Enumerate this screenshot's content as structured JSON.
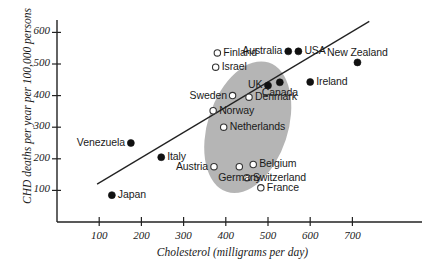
{
  "chart_data": {
    "type": "scatter",
    "title": "",
    "xlabel": "Cholesterol (milligrams per day)",
    "ylabel": "CHD deaths per year per 100,000 persons",
    "xlim": [
      0,
      760
    ],
    "ylim": [
      0,
      660
    ],
    "xticks": [
      100,
      200,
      300,
      400,
      500,
      600,
      700
    ],
    "yticks": [
      100,
      200,
      300,
      400,
      500,
      600
    ],
    "grid": false,
    "legend": "none",
    "marker_styles": {
      "filled": "solid black circle (outside cluster)",
      "open": "open circle (inside highlighted ellipse)"
    },
    "annotations": {
      "ellipse_note": "shaded gray ellipse highlighting the central European cluster",
      "trend_line": "upward-sloping straight regression line"
    },
    "trend_line": {
      "x1": 95,
      "y1": 120,
      "x2": 740,
      "y2": 635
    },
    "ellipse": {
      "cx": 452,
      "cy": 300,
      "rx": 95,
      "ry": 215,
      "rotation_deg": 18,
      "color": "#a8a8a8"
    },
    "points": [
      {
        "label": "Japan",
        "x": 130,
        "y": 85,
        "marker": "filled",
        "label_pos": "right"
      },
      {
        "label": "Venezuela",
        "x": 175,
        "y": 250,
        "marker": "filled",
        "label_pos": "left"
      },
      {
        "label": "Italy",
        "x": 247,
        "y": 205,
        "marker": "filled",
        "label_pos": "right"
      },
      {
        "label": "Austria",
        "x": 372,
        "y": 175,
        "marker": "open",
        "label_pos": "left"
      },
      {
        "label": "Finland",
        "x": 380,
        "y": 535,
        "marker": "open",
        "label_pos": "right"
      },
      {
        "label": "Israel",
        "x": 376,
        "y": 490,
        "marker": "open",
        "label_pos": "right"
      },
      {
        "label": "Sweden",
        "x": 416,
        "y": 400,
        "marker": "open",
        "label_pos": "left"
      },
      {
        "label": "Norway",
        "x": 370,
        "y": 352,
        "marker": "open",
        "label_pos": "right"
      },
      {
        "label": "Netherlands",
        "x": 395,
        "y": 300,
        "marker": "open",
        "label_pos": "right"
      },
      {
        "label": "Germany",
        "x": 432,
        "y": 175,
        "marker": "open",
        "label_pos": "below"
      },
      {
        "label": "Belgium",
        "x": 465,
        "y": 182,
        "marker": "open",
        "label_pos": "right"
      },
      {
        "label": "Switzerland",
        "x": 450,
        "y": 140,
        "marker": "open",
        "label_pos": "right"
      },
      {
        "label": "France",
        "x": 483,
        "y": 108,
        "marker": "open",
        "label_pos": "right"
      },
      {
        "label": "Denmark",
        "x": 455,
        "y": 395,
        "marker": "open",
        "label_pos": "right"
      },
      {
        "label": "UK",
        "x": 500,
        "y": 432,
        "marker": "filled",
        "label_pos": "left"
      },
      {
        "label": "Canada",
        "x": 528,
        "y": 442,
        "marker": "filled",
        "label_pos": "below"
      },
      {
        "label": "Australia",
        "x": 548,
        "y": 540,
        "marker": "filled",
        "label_pos": "left"
      },
      {
        "label": "USA",
        "x": 572,
        "y": 540,
        "marker": "filled",
        "label_pos": "right"
      },
      {
        "label": "Ireland",
        "x": 600,
        "y": 443,
        "marker": "filled",
        "label_pos": "right"
      },
      {
        "label": "New Zealand",
        "x": 712,
        "y": 505,
        "marker": "filled",
        "label_pos": "above"
      }
    ]
  }
}
